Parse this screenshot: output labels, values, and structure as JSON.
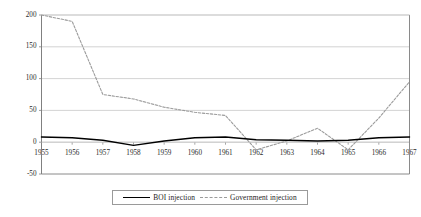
{
  "chart_data": {
    "type": "line",
    "title": "",
    "xlabel": "",
    "ylabel": "",
    "x": [
      1955,
      1956,
      1957,
      1958,
      1959,
      1960,
      1961,
      1962,
      1963,
      1964,
      1965,
      1966,
      1967
    ],
    "categories": [
      "1955",
      "1956",
      "1957",
      "1958",
      "1959",
      "1960",
      "1961",
      "1962",
      "1963",
      "1964",
      "1965",
      "1966",
      "1967"
    ],
    "xtick_labels": [
      "1955",
      "1956",
      "1957",
      "1958",
      "1959",
      "1960",
      "1961",
      "1962",
      "1963",
      "1964",
      "1965",
      "1966",
      "1967"
    ],
    "ytick_labels": [
      "200",
      "150",
      "100",
      "50",
      "0",
      "-50"
    ],
    "yticks": [
      200,
      150,
      100,
      50,
      0,
      -50
    ],
    "ylim": [
      -50,
      200
    ],
    "xlim": [
      1955,
      1967
    ],
    "grid": true,
    "grid_axis": "y",
    "legend_position": "bottom",
    "series": [
      {
        "name": "BOI injection",
        "style": "solid",
        "color": "#000000",
        "values": [
          8,
          7,
          3,
          -5,
          2,
          7,
          8,
          4,
          3,
          2,
          3,
          7,
          8
        ]
      },
      {
        "name": "Government injection",
        "style": "dashed",
        "color": "#9b9b9b",
        "values": [
          200,
          190,
          75,
          68,
          55,
          47,
          42,
          -12,
          2,
          22,
          -12,
          38,
          95
        ]
      }
    ]
  },
  "legend": {
    "items": [
      {
        "label": "BOI injection"
      },
      {
        "label": "Government  injection"
      }
    ]
  },
  "colors": {
    "series_boi": "#000000",
    "series_government": "#9b9b9b",
    "axis": "#808080",
    "grid": "#c8c8c8",
    "plot_border": "#8a8a8a",
    "background": "#ffffff"
  }
}
